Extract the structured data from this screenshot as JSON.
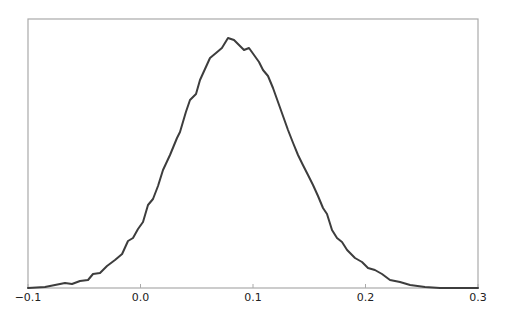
{
  "chart_data": {
    "type": "line",
    "title": "",
    "xlabel": "",
    "ylabel": "",
    "xlim": [
      -0.1,
      0.3
    ],
    "ylim": [
      0,
      1.0
    ],
    "grid": false,
    "legend": null,
    "xticks": [
      -0.1,
      0.0,
      0.1,
      0.2,
      0.3
    ],
    "xtick_labels": [
      "−0.1",
      "0.0",
      "0.1",
      "0.2",
      "0.3"
    ],
    "yticks": [],
    "series": [
      {
        "name": "density",
        "color": "#3d3d3d",
        "x": [
          -0.1,
          -0.0849,
          -0.076,
          -0.0671,
          -0.0609,
          -0.0538,
          -0.0467,
          -0.0422,
          -0.036,
          -0.0298,
          -0.0227,
          -0.0164,
          -0.0111,
          -0.0067,
          -0.0022,
          0.0022,
          0.0067,
          0.0111,
          0.0156,
          0.02,
          0.0262,
          0.0324,
          0.0351,
          0.0404,
          0.044,
          0.0493,
          0.0529,
          0.0573,
          0.0618,
          0.0671,
          0.0724,
          0.0778,
          0.0831,
          0.0884,
          0.092,
          0.0964,
          0.1009,
          0.1053,
          0.1089,
          0.1133,
          0.1178,
          0.1222,
          0.1267,
          0.1311,
          0.1356,
          0.14,
          0.1444,
          0.1489,
          0.1533,
          0.1578,
          0.1622,
          0.1658,
          0.1702,
          0.1747,
          0.1791,
          0.1836,
          0.1907,
          0.1969,
          0.2022,
          0.2084,
          0.2147,
          0.2218,
          0.2307,
          0.2396,
          0.2529,
          0.2662,
          0.2849,
          0.3
        ],
        "y": [
          0.0,
          0.004,
          0.012,
          0.02,
          0.016,
          0.028,
          0.032,
          0.056,
          0.06,
          0.088,
          0.112,
          0.136,
          0.188,
          0.2,
          0.236,
          0.264,
          0.332,
          0.356,
          0.408,
          0.472,
          0.532,
          0.6,
          0.624,
          0.704,
          0.752,
          0.776,
          0.832,
          0.876,
          0.92,
          0.94,
          0.96,
          1.0,
          0.992,
          0.968,
          0.952,
          0.96,
          0.932,
          0.904,
          0.872,
          0.848,
          0.8,
          0.744,
          0.688,
          0.632,
          0.58,
          0.532,
          0.492,
          0.452,
          0.412,
          0.368,
          0.32,
          0.296,
          0.232,
          0.2,
          0.184,
          0.152,
          0.12,
          0.104,
          0.08,
          0.072,
          0.056,
          0.032,
          0.024,
          0.012,
          0.004,
          0.0,
          0.0,
          0.0
        ]
      }
    ]
  },
  "layout": {
    "plot_left": 28,
    "plot_top": 19,
    "plot_right": 478,
    "plot_bottom": 288,
    "peak_px": 38,
    "axis_color": "#aaaaaa",
    "line_color": "#3d3d3d"
  }
}
